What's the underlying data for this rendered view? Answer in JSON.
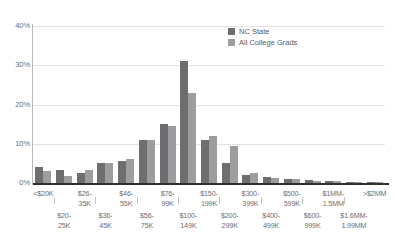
{
  "legend": {
    "position": "top-right",
    "items": [
      {
        "label": "NC State",
        "color": "#6e6e70",
        "key": "nc"
      },
      {
        "label": "All College Grads",
        "color": "#9d9d9f",
        "key": "acg"
      }
    ]
  },
  "axes": {
    "y_ticks": [
      "0%",
      "10%",
      "20%",
      "30%",
      "40%"
    ],
    "y_values": [
      0,
      10,
      20,
      30,
      40
    ]
  },
  "chart_data": {
    "type": "bar",
    "title": "",
    "subtitle": "",
    "xlabel": "",
    "ylabel": "",
    "ylim": [
      0,
      40
    ],
    "ytick_labels": [
      "0%",
      "10%",
      "20%",
      "30%",
      "40%"
    ],
    "ytick_values": [
      0,
      10,
      20,
      30,
      40
    ],
    "grid": true,
    "grid_axis": "y",
    "units": "percent",
    "legend_position": "top-right",
    "categories": [
      "<$20K",
      "$20-25K",
      "$26-35K",
      "$36-45K",
      "$46-55K",
      "$56-75K",
      "$76-99K",
      "$100-149K",
      "$150-199K",
      "$200-299K",
      "$300-399K",
      "$400-499K",
      "$500-599K",
      "$600-999K",
      "$1MM-1.5MM",
      "$1.6MM-1.99MM",
      ">$2MM"
    ],
    "series": [
      {
        "name": "NC State",
        "color": "#6e6e70",
        "values": [
          4.2,
          3.3,
          2.6,
          5.0,
          5.5,
          11.0,
          15.0,
          31.0,
          11.0,
          5.0,
          2.0,
          1.5,
          1.0,
          0.8,
          0.5,
          0.3,
          0.3
        ]
      },
      {
        "name": "All College Grads",
        "color": "#9d9d9f",
        "values": [
          3.0,
          1.7,
          3.4,
          5.0,
          6.0,
          11.0,
          14.6,
          23.0,
          12.0,
          9.5,
          2.6,
          1.2,
          1.0,
          0.6,
          0.5,
          0.3,
          0.3
        ]
      }
    ]
  },
  "x_label_lines": [
    {
      "text": "<$20K",
      "row": "top"
    },
    {
      "text": "$20-\n25K",
      "row": "bot"
    },
    {
      "text": "$26-\n35K",
      "row": "top"
    },
    {
      "text": "$36-\n45K",
      "row": "bot"
    },
    {
      "text": "$46-\n55K",
      "row": "top"
    },
    {
      "text": "$56-\n75K",
      "row": "bot"
    },
    {
      "text": "$76-\n99K",
      "row": "top"
    },
    {
      "text": "$100-\n149K",
      "row": "bot"
    },
    {
      "text": "$150-\n199K",
      "row": "top"
    },
    {
      "text": "$200-\n299K",
      "row": "bot"
    },
    {
      "text": "$300-\n399K",
      "row": "top"
    },
    {
      "text": "$400-\n499K",
      "row": "bot"
    },
    {
      "text": "$500-\n599K",
      "row": "top"
    },
    {
      "text": "$600-\n999K",
      "row": "bot"
    },
    {
      "text": "$1MM-\n1.5MM",
      "row": "top"
    },
    {
      "text": "$1.6MM-\n1.99MM",
      "row": "bot"
    },
    {
      "text": ">$2MM",
      "row": "top"
    }
  ]
}
